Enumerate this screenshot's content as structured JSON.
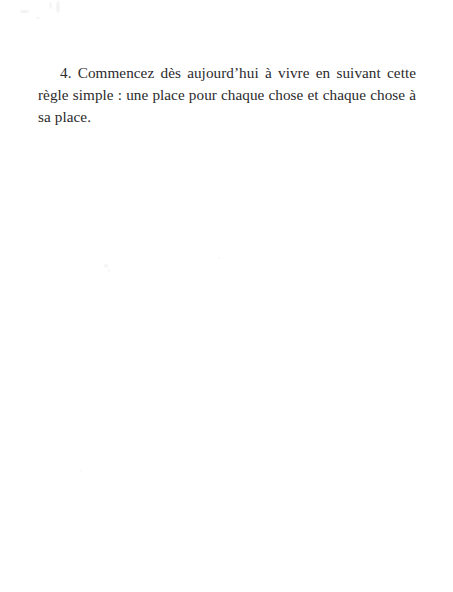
{
  "document": {
    "language": "fr",
    "page_background_color": "#ffffff",
    "text_color": "#2b2a2c",
    "body": {
      "paragraphs": [
        {
          "id": "item-4",
          "list_marker": "4.",
          "text": "4. Commencez dès aujourd’hui à vivre en suivant cette règle simple : une place pour chaque chose et chaque chose à sa place.",
          "lines": [
            "4. Commencez dès aujourd’hui à vivre en suivant cette règle",
            "simple : une place pour chaque chose et chaque chose à sa",
            "place."
          ]
        }
      ]
    }
  }
}
